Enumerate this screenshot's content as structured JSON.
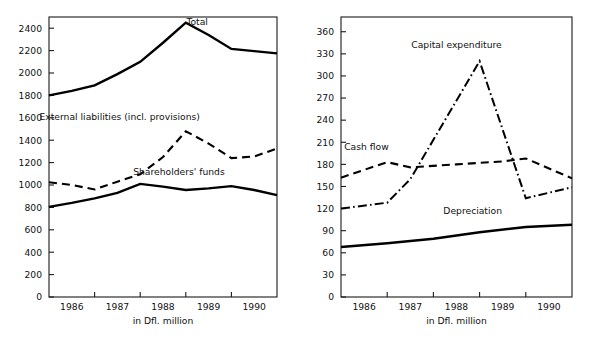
{
  "figure": {
    "background": "#ffffff",
    "line_color": "#000000",
    "axis_color": "#1a1a1a"
  },
  "chart_data": [
    {
      "id": "balance-sheet",
      "type": "line",
      "title": "",
      "xlabel": "in Dfl. million",
      "ylabel": "",
      "categories": [
        "1986",
        "1987",
        "1988",
        "1989",
        "1990"
      ],
      "x": [
        1986,
        1987,
        1988,
        1989,
        1990
      ],
      "xlim": [
        1985.5,
        1990.5
      ],
      "ylim": [
        0,
        2500
      ],
      "yticks": [
        0,
        200,
        400,
        600,
        800,
        1000,
        1200,
        1400,
        1600,
        1800,
        2000,
        2200,
        2400
      ],
      "ytick_labels": [
        "0",
        "200",
        "400",
        "600",
        "800",
        "1000",
        "1200",
        "1400",
        "1600",
        "1800",
        "2000",
        "2200",
        "2400"
      ],
      "grid": false,
      "legend_position": "inline-annotations",
      "series": [
        {
          "name": "Total",
          "style": "solid",
          "label_x": 1988.75,
          "label_y": 2430,
          "x": [
            1985.5,
            1986.0,
            1986.5,
            1987.0,
            1987.5,
            1988.0,
            1988.5,
            1989.0,
            1989.5,
            1990.0,
            1990.5
          ],
          "values": [
            1800,
            1840,
            1890,
            1990,
            2100,
            2270,
            2450,
            2340,
            2215,
            2195,
            2175
          ]
        },
        {
          "name": "External liabilities (incl. provisions)",
          "style": "dashed",
          "label_x": 1987.05,
          "label_y": 1580,
          "x": [
            1985.5,
            1986.0,
            1986.5,
            1987.0,
            1987.5,
            1988.0,
            1988.5,
            1989.0,
            1989.5,
            1990.0,
            1990.5
          ],
          "values": [
            1025,
            1000,
            960,
            1030,
            1095,
            1250,
            1480,
            1370,
            1240,
            1255,
            1325
          ]
        },
        {
          "name": "Shareholders' funds",
          "style": "solid",
          "label_x": 1988.35,
          "label_y": 1090,
          "x": [
            1985.5,
            1986.0,
            1986.5,
            1987.0,
            1987.5,
            1988.0,
            1988.5,
            1989.0,
            1989.5,
            1990.0,
            1990.5
          ],
          "values": [
            805,
            840,
            880,
            930,
            1010,
            985,
            955,
            970,
            990,
            955,
            910
          ]
        }
      ]
    },
    {
      "id": "cash-flow",
      "type": "line",
      "title": "",
      "xlabel": "in Dfl. million",
      "ylabel": "",
      "categories": [
        "1986",
        "1987",
        "1988",
        "1989",
        "1990"
      ],
      "x": [
        1986,
        1987,
        1988,
        1989,
        1990
      ],
      "xlim": [
        1985.5,
        1990.5
      ],
      "ylim": [
        0,
        380
      ],
      "yticks": [
        0,
        30,
        60,
        90,
        120,
        150,
        180,
        210,
        240,
        270,
        300,
        330,
        360
      ],
      "ytick_labels": [
        "0",
        "30",
        "60",
        "90",
        "120",
        "150",
        "180",
        "210",
        "240",
        "270",
        "300",
        "330",
        "360"
      ],
      "grid": false,
      "legend_position": "inline-annotations",
      "series": [
        {
          "name": "Capital expenditure",
          "style": "dashdot",
          "label_x": 1988.0,
          "label_y": 338,
          "x": [
            1985.5,
            1986.5,
            1987.0,
            1988.5,
            1989.5,
            1990.5
          ],
          "values": [
            120,
            128,
            160,
            320,
            134,
            149
          ]
        },
        {
          "name": "Cash flow",
          "style": "dashed",
          "label_x": 1986.05,
          "label_y": 200,
          "x": [
            1985.5,
            1986.5,
            1987.0,
            1988.0,
            1989.0,
            1989.5,
            1990.5
          ],
          "values": [
            162,
            183,
            176,
            180,
            184,
            188,
            161
          ]
        },
        {
          "name": "Depreciation",
          "style": "solid-thick",
          "label_x": 1988.35,
          "label_y": 112,
          "x": [
            1985.5,
            1986.5,
            1987.5,
            1988.5,
            1989.5,
            1990.5
          ],
          "values": [
            68,
            73,
            79,
            88,
            95,
            98
          ]
        }
      ]
    }
  ]
}
